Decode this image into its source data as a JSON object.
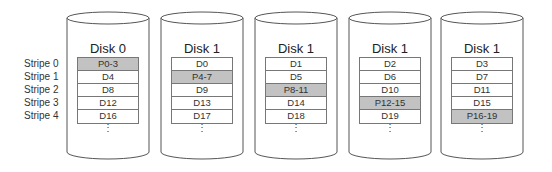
{
  "stripes": [
    "Stripe 0",
    "Stripe 1",
    "Stripe 2",
    "Stripe 3",
    "Stripe 4"
  ],
  "disks": [
    {
      "title": "Disk 0",
      "blocks": [
        "P0-3",
        "D4",
        "D8",
        "D12",
        "D16"
      ],
      "parity_row": 0
    },
    {
      "title": "Disk 1",
      "blocks": [
        "D0",
        "P4-7",
        "D9",
        "D13",
        "D17"
      ],
      "parity_row": 1
    },
    {
      "title": "Disk 1",
      "blocks": [
        "D1",
        "D5",
        "P8-11",
        "D14",
        "D18"
      ],
      "parity_row": 2
    },
    {
      "title": "Disk 1",
      "blocks": [
        "D2",
        "D6",
        "D10",
        "P12-15",
        "D19"
      ],
      "parity_row": 3
    },
    {
      "title": "Disk 1",
      "blocks": [
        "D3",
        "D7",
        "D11",
        "D15",
        "P16-19"
      ],
      "parity_row": 4
    }
  ],
  "ellipsis": "⋮",
  "colors": {
    "parity": "#c2c2c2",
    "data": "#ffffff",
    "outline": "#555555"
  }
}
